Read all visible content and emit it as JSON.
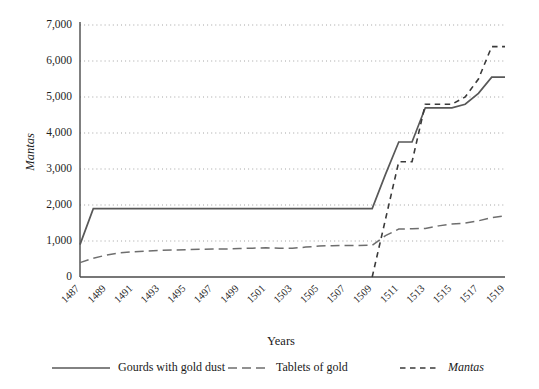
{
  "chart_data": {
    "type": "line",
    "title": "",
    "xlabel": "Years",
    "ylabel": "Mantas",
    "x": [
      1487,
      1488,
      1489,
      1490,
      1491,
      1492,
      1493,
      1494,
      1495,
      1496,
      1497,
      1498,
      1499,
      1500,
      1501,
      1502,
      1503,
      1504,
      1505,
      1506,
      1507,
      1508,
      1509,
      1510,
      1511,
      1512,
      1513,
      1514,
      1515,
      1516,
      1517,
      1518,
      1519
    ],
    "xticks": [
      "1487",
      "1489",
      "1491",
      "1493",
      "1495",
      "1497",
      "1499",
      "1501",
      "1503",
      "1505",
      "1507",
      "1509",
      "1511",
      "1513",
      "1515",
      "1517",
      "1519"
    ],
    "yticks": [
      "0",
      "1,000",
      "2,000",
      "3,000",
      "4,000",
      "5,000",
      "6,000",
      "7,000"
    ],
    "ylim": [
      0,
      7000
    ],
    "xlim": [
      1487,
      1519
    ],
    "grid": true,
    "legend_position": "bottom",
    "series": [
      {
        "name": "Gourds with gold dust",
        "style": "solid",
        "color": "#585858",
        "values": [
          900,
          1900,
          1900,
          1900,
          1900,
          1900,
          1900,
          1900,
          1900,
          1900,
          1900,
          1900,
          1900,
          1900,
          1900,
          1900,
          1900,
          1900,
          1900,
          1900,
          1900,
          1900,
          1900,
          2850,
          3750,
          3750,
          4700,
          4700,
          4700,
          4800,
          5100,
          5550,
          5550
        ]
      },
      {
        "name": "Tablets of gold",
        "style": "long-dash",
        "color": "#6e6e6e",
        "values": [
          400,
          520,
          610,
          670,
          700,
          720,
          740,
          750,
          760,
          770,
          775,
          780,
          790,
          800,
          810,
          800,
          800,
          830,
          860,
          870,
          875,
          878,
          880,
          1150,
          1330,
          1340,
          1350,
          1420,
          1470,
          1500,
          1560,
          1650,
          1700
        ]
      },
      {
        "name": "Mantas",
        "style": "short-dash",
        "color": "#3a3a3a",
        "italic_label": true,
        "values": [
          null,
          null,
          null,
          null,
          null,
          null,
          null,
          null,
          null,
          null,
          null,
          null,
          null,
          null,
          null,
          null,
          null,
          null,
          null,
          null,
          null,
          null,
          0,
          1600,
          3200,
          3200,
          4800,
          4800,
          4800,
          5000,
          5500,
          6400,
          6400
        ]
      }
    ]
  },
  "legend": {
    "items": [
      {
        "label": "Gourds with gold dust",
        "style": "solid"
      },
      {
        "label": "Tablets of gold",
        "style": "long-dash"
      },
      {
        "label": "Mantas",
        "style": "short-dash"
      }
    ]
  }
}
